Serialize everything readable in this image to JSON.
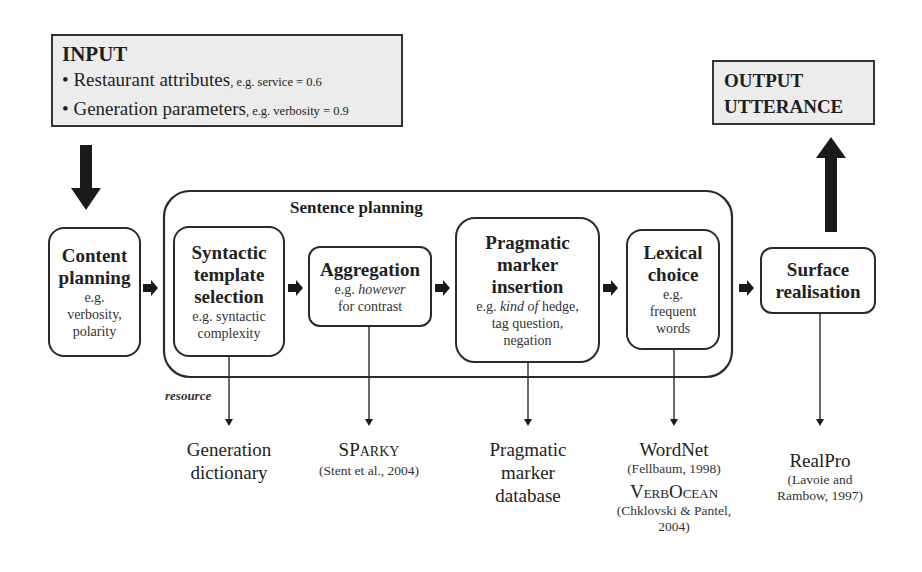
{
  "input": {
    "heading": "INPUT",
    "items": [
      {
        "bullet": "•",
        "label": "Restaurant attributes",
        "example": ", e.g. service = 0.6"
      },
      {
        "bullet": "•",
        "label": "Generation parameters",
        "example": ", e.g. verbosity = 0.9"
      }
    ]
  },
  "output": {
    "line1": "OUTPUT",
    "line2": "UTTERANCE"
  },
  "sentence_planning": {
    "label": "Sentence planning"
  },
  "stages": {
    "content": {
      "title1": "Content",
      "title2": "planning",
      "sub1": "e.g.",
      "sub2": "verbosity,",
      "sub3": "polarity"
    },
    "syntactic": {
      "title1": "Syntactic",
      "title2": "template",
      "title3": "selection",
      "sub1": "e.g. syntactic",
      "sub2": "complexity"
    },
    "aggregation": {
      "title1": "Aggregation",
      "sub1_plain": "e.g. ",
      "sub1_italic": "however",
      "sub2": "for contrast"
    },
    "pragmatic": {
      "title1": "Pragmatic",
      "title2": "marker",
      "title3": "insertion",
      "sub1_plain": "e.g. ",
      "sub1_italic": "kind of",
      "sub1_rest": " hedge,",
      "sub2": "tag question,",
      "sub3": "negation"
    },
    "lexical": {
      "title1": "Lexical",
      "title2": "choice",
      "sub1": "e.g.",
      "sub2": "frequent",
      "sub3": "words"
    },
    "surface": {
      "title1": "Surface",
      "title2": "realisation"
    }
  },
  "resource_label": "resource",
  "resources": {
    "generation_dictionary": {
      "line1": "Generation",
      "line2": "dictionary"
    },
    "sparky": {
      "name_a": "SP",
      "name_b": "ARK",
      "name_c": "Y",
      "cite": "(Stent et al., 2004)"
    },
    "pragmatic_db": {
      "line1": "Pragmatic",
      "line2": "marker",
      "line3": "database"
    },
    "wordnet": {
      "name": "WordNet",
      "cite": "(Fellbaum, 1998)"
    },
    "verbocean": {
      "name_a": "Verb",
      "name_b": "Ocean",
      "cite1": "(Chklovski & Pantel,",
      "cite2": "2004)"
    },
    "realpro": {
      "name": "RealPro",
      "cite1": "(Lavoie and",
      "cite2": "Rambow, 1997)"
    }
  },
  "colors": {
    "box_fill": "#ececec",
    "stroke": "#2a2a2a",
    "background": "#ffffff"
  }
}
